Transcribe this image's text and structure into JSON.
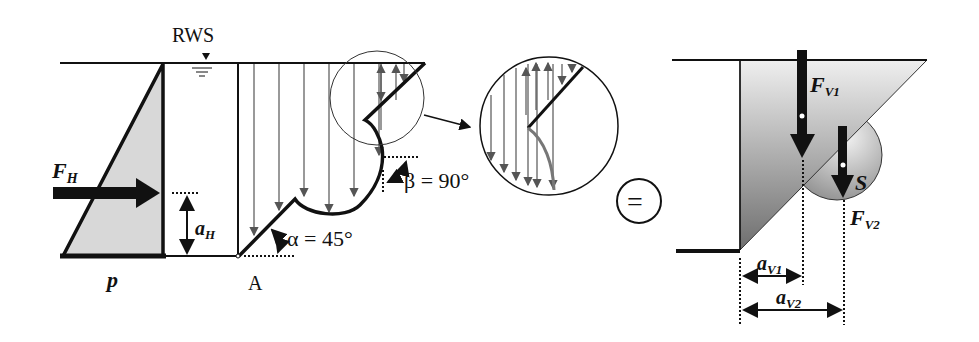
{
  "labels": {
    "rws": "RWS",
    "fh_main": "F",
    "fh_sub": "H",
    "ah_main": "a",
    "ah_sub": "H",
    "p": "p",
    "point_a": "A",
    "alpha": "α = 45°",
    "beta": "β = 90°",
    "equals": "=",
    "fv1_main": "F",
    "fv1_sub": "V1",
    "fv2_main": "F",
    "fv2_sub": "V2",
    "s": "S",
    "av1_main": "a",
    "av1_sub": "V1",
    "av2_main": "a",
    "av2_sub": "V2"
  },
  "colors": {
    "line": "#111111",
    "fill_light": "#d8d8d8",
    "fill_dark": "#707070",
    "arrow_gray": "#555555"
  }
}
